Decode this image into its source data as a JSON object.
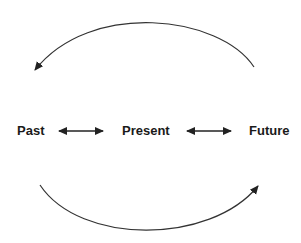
{
  "diagram": {
    "nodes": [
      {
        "id": "past",
        "label": "Past"
      },
      {
        "id": "present",
        "label": "Present"
      },
      {
        "id": "future",
        "label": "Future"
      }
    ],
    "edges": [
      {
        "from": "past",
        "to": "present",
        "type": "bidirectional-arrow"
      },
      {
        "from": "present",
        "to": "future",
        "type": "bidirectional-arrow"
      },
      {
        "from": "future",
        "to": "past",
        "type": "curved-arrow-top"
      },
      {
        "from": "past",
        "to": "future",
        "type": "curved-arrow-bottom"
      }
    ],
    "colors": {
      "stroke": "#333333",
      "text": "#1a1a1a",
      "background": "#ffffff"
    }
  }
}
